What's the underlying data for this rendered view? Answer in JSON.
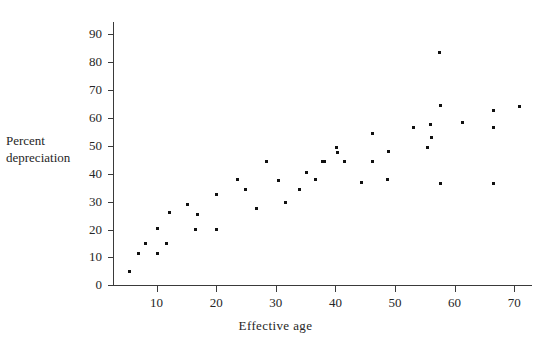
{
  "chart_data": {
    "type": "scatter",
    "title": "",
    "xlabel": "Effective age",
    "ylabel": "Percent depreciation",
    "ylabel_lines": [
      "Percent",
      "depreciation"
    ],
    "xlim": [
      0,
      72
    ],
    "ylim": [
      0,
      95
    ],
    "xticks": [
      10,
      20,
      30,
      40,
      50,
      60,
      70
    ],
    "yticks": [
      0,
      10,
      20,
      30,
      40,
      50,
      60,
      70,
      80,
      90
    ],
    "grid": false,
    "legend": false,
    "marker": {
      "shape": "square",
      "size_px": 3,
      "color": "#111111"
    },
    "axis_color": "#3a3a3a",
    "background": "#ffffff",
    "points": [
      {
        "x": 5.5,
        "y": 5
      },
      {
        "x": 6.9,
        "y": 11.5
      },
      {
        "x": 8.2,
        "y": 15
      },
      {
        "x": 10.1,
        "y": 11.5
      },
      {
        "x": 10.2,
        "y": 20.5
      },
      {
        "x": 11.7,
        "y": 15
      },
      {
        "x": 12.2,
        "y": 26
      },
      {
        "x": 15.1,
        "y": 29
      },
      {
        "x": 16.6,
        "y": 20
      },
      {
        "x": 16.8,
        "y": 25.5
      },
      {
        "x": 20.0,
        "y": 32.5
      },
      {
        "x": 20.1,
        "y": 20
      },
      {
        "x": 23.5,
        "y": 38
      },
      {
        "x": 24.9,
        "y": 34.5
      },
      {
        "x": 26.8,
        "y": 27.5
      },
      {
        "x": 28.5,
        "y": 44.5
      },
      {
        "x": 30.4,
        "y": 37.5
      },
      {
        "x": 31.7,
        "y": 29.5
      },
      {
        "x": 33.9,
        "y": 34.5
      },
      {
        "x": 35.1,
        "y": 40.5
      },
      {
        "x": 36.6,
        "y": 38
      },
      {
        "x": 37.9,
        "y": 44.5
      },
      {
        "x": 38.1,
        "y": 44.5
      },
      {
        "x": 40.1,
        "y": 49.5
      },
      {
        "x": 40.3,
        "y": 47.5
      },
      {
        "x": 41.5,
        "y": 44.5
      },
      {
        "x": 44.3,
        "y": 37
      },
      {
        "x": 46.2,
        "y": 54.5
      },
      {
        "x": 46.3,
        "y": 44.5
      },
      {
        "x": 48.8,
        "y": 38
      },
      {
        "x": 48.9,
        "y": 48
      },
      {
        "x": 53.1,
        "y": 56.5
      },
      {
        "x": 55.5,
        "y": 49.5
      },
      {
        "x": 56.0,
        "y": 57.5
      },
      {
        "x": 56.1,
        "y": 53
      },
      {
        "x": 57.4,
        "y": 83.5
      },
      {
        "x": 57.6,
        "y": 64.5
      },
      {
        "x": 57.7,
        "y": 36.5
      },
      {
        "x": 61.4,
        "y": 58.5
      },
      {
        "x": 66.6,
        "y": 62.5
      },
      {
        "x": 66.6,
        "y": 56.5
      },
      {
        "x": 66.6,
        "y": 36.5
      },
      {
        "x": 70.8,
        "y": 64
      }
    ]
  }
}
